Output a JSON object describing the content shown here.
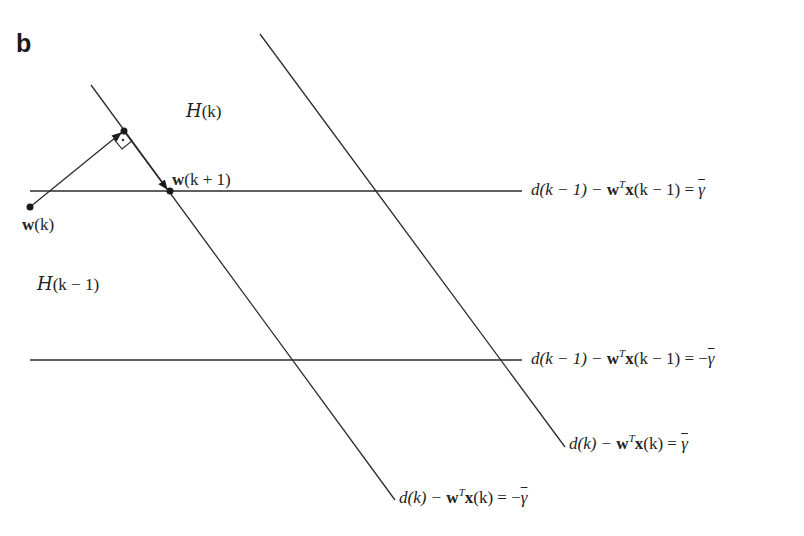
{
  "figure": {
    "panel_label": "b",
    "colors": {
      "line": "#2b2b2b",
      "background": "#ffffff",
      "text": "#222222"
    }
  },
  "regions": {
    "h_k": {
      "symbol": "H",
      "arg": "(k)"
    },
    "h_k_minus_1": {
      "symbol": "H",
      "arg": "(k − 1)"
    }
  },
  "points": {
    "w_k": {
      "bold": "w",
      "arg": "(k)"
    },
    "w_k_plus_1": {
      "bold": "w",
      "arg": "(k + 1)"
    }
  },
  "constraints": [
    {
      "id": "prev_upper",
      "lhs_d": "d(k − 1) − ",
      "w": "w",
      "sup": "T",
      "x": "x",
      "arg": "(k − 1) = ",
      "rhs": "γ",
      "sign": ""
    },
    {
      "id": "prev_lower",
      "lhs_d": "d(k − 1) − ",
      "w": "w",
      "sup": "T",
      "x": "x",
      "arg": "(k − 1) = ",
      "rhs": "γ",
      "sign": "−"
    },
    {
      "id": "curr_upper",
      "lhs_d": "d(k) − ",
      "w": "w",
      "sup": "T",
      "x": "x",
      "arg": "(k) = ",
      "rhs": "γ",
      "sign": ""
    },
    {
      "id": "curr_lower",
      "lhs_d": "d(k) − ",
      "w": "w",
      "sup": "T",
      "x": "x",
      "arg": "(k) = ",
      "rhs": "γ",
      "sign": "−"
    }
  ]
}
